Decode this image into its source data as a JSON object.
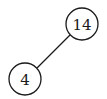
{
  "diagram": {
    "type": "binary-tree",
    "nodes": [
      {
        "id": "root",
        "label": "14",
        "cx": 82,
        "cy": 24,
        "r": 16
      },
      {
        "id": "left",
        "label": "4",
        "cx": 25,
        "cy": 79,
        "r": 16
      }
    ],
    "edges": [
      {
        "from": "root",
        "to": "left",
        "x1": 70,
        "y1": 35,
        "x2": 37,
        "y2": 68
      }
    ],
    "colors": {
      "stroke": "#1a1a1a",
      "background": "#ffffff"
    }
  }
}
